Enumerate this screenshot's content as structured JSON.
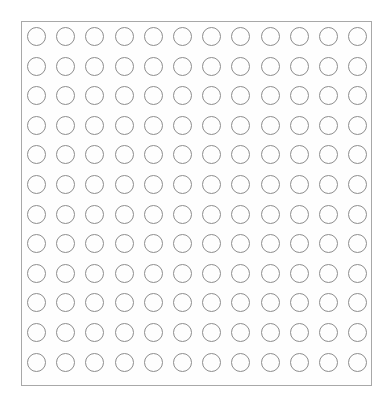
{
  "canvas": {
    "width": 391,
    "height": 393,
    "background_color": "#ffffff"
  },
  "panel": {
    "name": "circle-grid-panel",
    "left": 21,
    "top": 21,
    "width": 351,
    "height": 365,
    "border_color": "#a8a8a8",
    "border_width": 1,
    "fill_color": "#fefefe"
  },
  "grid": {
    "rows": 12,
    "columns": 12,
    "total_cells": 144,
    "cell_shape": "circle",
    "circle_diameter": 19,
    "circle_stroke_color": "#8d8d8d",
    "circle_stroke_width": 1,
    "circle_fill": "transparent",
    "column_pitch": 29.2,
    "row_pitch": 29.6,
    "first_circle_offset_x": 5,
    "first_circle_offset_y": 5,
    "row_labels": [
      "1",
      "2",
      "3",
      "4",
      "5",
      "6",
      "7",
      "8",
      "9",
      "10",
      "11",
      "12"
    ],
    "column_labels": [
      "1",
      "2",
      "3",
      "4",
      "5",
      "6",
      "7",
      "8",
      "9",
      "10",
      "11",
      "12"
    ]
  }
}
